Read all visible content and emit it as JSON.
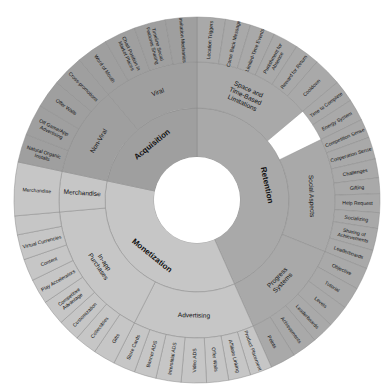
{
  "chart_data": {
    "type": "sunburst",
    "title": "",
    "center": [
      197,
      200
    ],
    "radii": [
      43,
      92,
      138,
      183
    ],
    "colors": {
      "Retention": "#a9a9a9",
      "Monetization": "#c6c6c6",
      "Acquisition": "#9f9f9f",
      "hole": "#ffffff"
    },
    "tree": [
      {
        "name": "Retention",
        "start": 0,
        "end": 156,
        "children": [
          {
            "name": "Space and Time-Based Limitations",
            "start": 0,
            "end": 50,
            "children": [
              {
                "name": "Location Triggers",
                "start": 0,
                "end": 9
              },
              {
                "name": "Come Back Message",
                "start": 9,
                "end": 17
              },
              {
                "name": "Limited-Time Events",
                "start": 17,
                "end": 25
              },
              {
                "name": "Punishment for Absence",
                "start": 25,
                "end": 33
              },
              {
                "name": "Reward for Return",
                "start": 33,
                "end": 41
              },
              {
                "name": "Cooldown",
                "start": 41,
                "end": 50
              },
              {
                "name": "Time to Complete",
                "start": 50,
                "end": 57
              },
              {
                "name": "Energy System",
                "start": 57,
                "end": 64
              }
            ]
          },
          {
            "name": "Social Aspects",
            "start": 64,
            "end": 112,
            "children": [
              {
                "name": "Competition Sense",
                "start": 64,
                "end": 70
              },
              {
                "name": "Cooperation Sense",
                "start": 70,
                "end": 77
              },
              {
                "name": "Challenges",
                "start": 77,
                "end": 83
              },
              {
                "name": "Gifting",
                "start": 83,
                "end": 88
              },
              {
                "name": "Help Request",
                "start": 88,
                "end": 94
              },
              {
                "name": "Socializing",
                "start": 94,
                "end": 99
              },
              {
                "name": "Sharing of Achievements",
                "start": 99,
                "end": 106
              },
              {
                "name": "Leaderboards",
                "start": 106,
                "end": 112
              }
            ]
          },
          {
            "name": "Progress Systems",
            "start": 112,
            "end": 156,
            "children": [
              {
                "name": "Objective",
                "start": 112,
                "end": 119
              },
              {
                "name": "Tutorial",
                "start": 119,
                "end": 126
              },
              {
                "name": "Levels",
                "start": 126,
                "end": 133
              },
              {
                "name": "Leaderboards",
                "start": 133,
                "end": 140
              },
              {
                "name": "Achievements",
                "start": 140,
                "end": 148
              },
              {
                "name": "Points",
                "start": 148,
                "end": 156
              }
            ]
          }
        ]
      },
      {
        "name": "Monetization",
        "start": 156,
        "end": 282,
        "children": [
          {
            "name": "Advertising",
            "start": 156,
            "end": 207,
            "children": [
              {
                "name": "Product Placement",
                "start": 156,
                "end": 163
              },
              {
                "name": "Affiliate Linking",
                "start": 163,
                "end": 170
              },
              {
                "name": "Offer Walls",
                "start": 170,
                "end": 177
              },
              {
                "name": "Video ADS",
                "start": 177,
                "end": 185
              },
              {
                "name": "Interstitial ADS",
                "start": 185,
                "end": 193
              },
              {
                "name": "Banner ADS",
                "start": 193,
                "end": 200
              },
              {
                "name": "Store Cards",
                "start": 200,
                "end": 207
              }
            ]
          },
          {
            "name": "In-app Purchases",
            "start": 207,
            "end": 265,
            "children": [
              {
                "name": "Gifts",
                "start": 207,
                "end": 214
              },
              {
                "name": "Collectibles",
                "start": 214,
                "end": 221
              },
              {
                "name": "Customization",
                "start": 221,
                "end": 228
              },
              {
                "name": "Competitive Advantage",
                "start": 228,
                "end": 236
              },
              {
                "name": "Play Accelerators",
                "start": 236,
                "end": 244
              },
              {
                "name": "Content",
                "start": 244,
                "end": 251
              },
              {
                "name": "Virtual Currencies",
                "start": 251,
                "end": 259
              },
              {
                "name": "",
                "start": 259,
                "end": 265
              }
            ]
          },
          {
            "name": "Merchandise",
            "start": 265,
            "end": 282,
            "children": [
              {
                "name": "Merchandise",
                "start": 265,
                "end": 282
              }
            ]
          }
        ]
      },
      {
        "name": "Acquisition",
        "start": 282,
        "end": 360,
        "children": [
          {
            "name": "Non-Viral",
            "start": 282,
            "end": 320,
            "children": [
              {
                "name": "Natural Organic Installs",
                "start": 282,
                "end": 291
              },
              {
                "name": "Off Game/App Advertising",
                "start": 291,
                "end": 301
              },
              {
                "name": "Offer Walls",
                "start": 301,
                "end": 310
              },
              {
                "name": "Cross-promotions",
                "start": 310,
                "end": 320
              }
            ]
          },
          {
            "name": "Viral",
            "start": 320,
            "end": 360,
            "children": [
              {
                "name": "Word of Mouth",
                "start": 320,
                "end": 330
              },
              {
                "name": "Chart Position in Market Places",
                "start": 330,
                "end": 340
              },
              {
                "name": "Timeline Social Features Sharing",
                "start": 340,
                "end": 350
              },
              {
                "name": "Invitation Mechanics",
                "start": 350,
                "end": 360
              }
            ]
          }
        ]
      }
    ]
  }
}
